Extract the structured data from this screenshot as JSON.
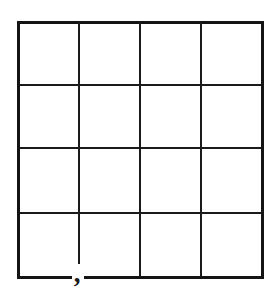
{
  "figure": {
    "background_color": "#ffffff",
    "line_color": "#1a1a1a",
    "outer_line_color": "#141414",
    "line_width": 2.6,
    "outer_line_width": 3.0,
    "columns": 4,
    "rows": 4,
    "bounds": {
      "left": 18,
      "top": 22,
      "right": 262,
      "bottom": 277
    },
    "vertical_line_x": [
      18,
      79,
      140,
      201,
      262
    ],
    "horizontal_line_y": [
      22,
      85,
      148,
      213,
      277
    ],
    "annotations": [
      {
        "name": "comma-mark",
        "glyph": ",",
        "x": 77,
        "y": 273,
        "note": "comma drawn at the bottom edge below the first interior vertical line"
      }
    ],
    "cells": [
      {
        "row": 1,
        "col": 1,
        "label": ""
      },
      {
        "row": 1,
        "col": 2,
        "label": ""
      },
      {
        "row": 1,
        "col": 3,
        "label": ""
      },
      {
        "row": 1,
        "col": 4,
        "label": ""
      },
      {
        "row": 2,
        "col": 1,
        "label": ""
      },
      {
        "row": 2,
        "col": 2,
        "label": ""
      },
      {
        "row": 2,
        "col": 3,
        "label": ""
      },
      {
        "row": 2,
        "col": 4,
        "label": ""
      },
      {
        "row": 3,
        "col": 1,
        "label": ""
      },
      {
        "row": 3,
        "col": 2,
        "label": ""
      },
      {
        "row": 3,
        "col": 3,
        "label": ""
      },
      {
        "row": 3,
        "col": 4,
        "label": ""
      },
      {
        "row": 4,
        "col": 1,
        "label": ""
      },
      {
        "row": 4,
        "col": 2,
        "label": ""
      },
      {
        "row": 4,
        "col": 3,
        "label": ""
      },
      {
        "row": 4,
        "col": 4,
        "label": ""
      }
    ]
  }
}
